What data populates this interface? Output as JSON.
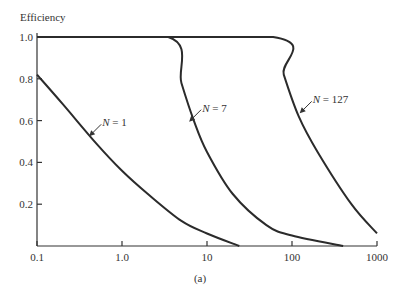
{
  "chart_data": {
    "type": "line",
    "title": "",
    "caption": "(a)",
    "xlabel": "",
    "ylabel": "Efficiency",
    "xscale": "log",
    "xlim": [
      0.1,
      1000
    ],
    "ylim": [
      0,
      1.0
    ],
    "xticks": [
      0.1,
      1.0,
      10,
      100,
      1000
    ],
    "xtick_labels": [
      "0.1",
      "1.0",
      "10",
      "100",
      "1000"
    ],
    "yticks": [
      0.2,
      0.4,
      0.6,
      0.8,
      1.0
    ],
    "ytick_labels": [
      "0.2",
      "0.4",
      "0.6",
      "0.8",
      "1.0"
    ],
    "grid": false,
    "legend": "none (inline annotations)",
    "series": [
      {
        "name": "N = 1",
        "x": [
          0.1,
          0.2,
          0.5,
          1.0,
          2,
          5,
          10,
          24
        ],
        "values": [
          0.82,
          0.68,
          0.49,
          0.36,
          0.25,
          0.12,
          0.06,
          0.0
        ]
      },
      {
        "name": "N = 7",
        "x": [
          0.1,
          3.5,
          5,
          7,
          10,
          20,
          50,
          100,
          400
        ],
        "values": [
          1.0,
          1.0,
          0.78,
          0.6,
          0.45,
          0.25,
          0.1,
          0.05,
          0.0
        ]
      },
      {
        "name": "N = 127",
        "x": [
          0.1,
          60,
          80,
          120,
          200,
          500,
          1000
        ],
        "values": [
          1.0,
          1.0,
          0.82,
          0.62,
          0.45,
          0.2,
          0.06
        ]
      }
    ],
    "annotations": [
      {
        "text": "N = 1",
        "at_x": 0.4,
        "at_y": 0.52
      },
      {
        "text": "N = 7",
        "at_x": 6,
        "at_y": 0.59
      },
      {
        "text": "N = 127",
        "at_x": 120,
        "at_y": 0.63
      }
    ]
  }
}
